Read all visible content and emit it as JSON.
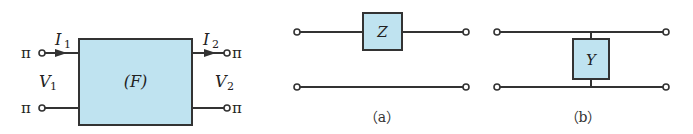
{
  "colors": {
    "box_fill": "#bfe3f0",
    "stroke": "#333333",
    "text": "#222222"
  },
  "two_port": {
    "label": "(F)",
    "terminal_symbol": "π",
    "i1": {
      "main": "I",
      "sub": "1"
    },
    "i2": {
      "main": "I",
      "sub": "2"
    },
    "v1": {
      "main": "V",
      "sub": "1"
    },
    "v2": {
      "main": "V",
      "sub": "2"
    }
  },
  "series_element": {
    "label": "Z",
    "caption": "（a）"
  },
  "shunt_element": {
    "label": "Y",
    "caption": "（b）"
  }
}
